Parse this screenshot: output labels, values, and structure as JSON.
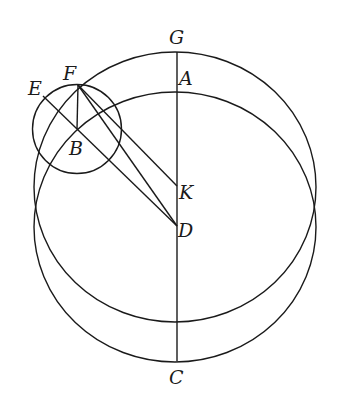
{
  "diagram": {
    "type": "geometric-construction",
    "background": "#ffffff",
    "stroke_color": "#1a1a1a",
    "points": {
      "G": {
        "label": "G",
        "x": 177,
        "y": 52
      },
      "A": {
        "label": "A",
        "x": 177,
        "y": 92
      },
      "F": {
        "label": "F",
        "x": 78,
        "y": 85
      },
      "E": {
        "label": "E",
        "x": 43,
        "y": 96
      },
      "B": {
        "label": "B",
        "x": 77,
        "y": 129
      },
      "K": {
        "label": "K",
        "x": 177,
        "y": 186
      },
      "D": {
        "label": "D",
        "x": 177,
        "y": 226
      },
      "C": {
        "label": "C",
        "x": 177,
        "y": 361
      }
    },
    "circles": [
      {
        "name": "circle-K",
        "center": "K",
        "cx": 175,
        "cy": 187,
        "rx": 141,
        "ry": 135
      },
      {
        "name": "circle-D",
        "center": "D",
        "cx": 175,
        "cy": 227,
        "rx": 141,
        "ry": 135
      },
      {
        "name": "epicycle-B",
        "center": "B",
        "cx": 77,
        "cy": 129,
        "rx": 44,
        "ry": 44
      }
    ],
    "segments": [
      {
        "from": "G",
        "to": "C"
      },
      {
        "from": "F",
        "to": "B"
      },
      {
        "from": "F",
        "to": "K"
      },
      {
        "from": "F",
        "to": "D"
      },
      {
        "from": "E",
        "to": "D"
      }
    ],
    "labels": {
      "G": "G",
      "A": "A",
      "F": "F",
      "E": "E",
      "B": "B",
      "K": "K",
      "D": "D",
      "C": "C"
    }
  }
}
